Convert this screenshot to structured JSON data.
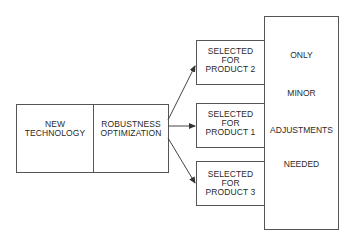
{
  "diagram": {
    "left_block": {
      "cells": [
        {
          "label_lines": [
            "NEW",
            "TECHNOLOGY"
          ]
        },
        {
          "label_lines": [
            "ROBUSTNESS",
            "OPTIMIZATION"
          ]
        }
      ]
    },
    "products": [
      {
        "label_lines": [
          "SELECTED",
          "FOR",
          "PRODUCT 2"
        ]
      },
      {
        "label_lines": [
          "SELECTED",
          "FOR",
          "PRODUCT 1"
        ]
      },
      {
        "label_lines": [
          "SELECTED",
          "FOR",
          "PRODUCT 3"
        ]
      }
    ],
    "right_block": {
      "words": [
        "ONLY",
        "MINOR",
        "ADJUSTMENTS",
        "NEEDED"
      ]
    },
    "colors": {
      "line": "#555555",
      "text": "#2a2a2a",
      "background": "#ffffff"
    }
  }
}
